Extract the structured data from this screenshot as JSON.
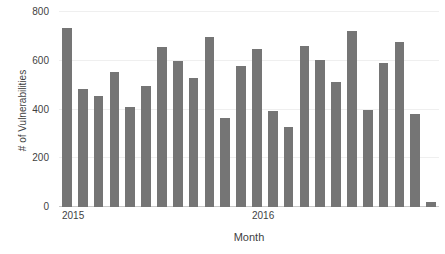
{
  "chart_data": {
    "type": "bar",
    "title": "",
    "xlabel": "Month",
    "ylabel": "# of Vulnerabilities",
    "ylim": [
      0,
      800
    ],
    "ytick_values": [
      0,
      200,
      400,
      600,
      800
    ],
    "ytick_labels": [
      "0",
      "200",
      "400",
      "600",
      "800"
    ],
    "grid": true,
    "legend": null,
    "bar_color": "#757575",
    "gridline_color": "#efefef",
    "axis_color": "#c9c9c9",
    "categories": [
      "2015-01",
      "2015-02",
      "2015-03",
      "2015-04",
      "2015-05",
      "2015-06",
      "2015-07",
      "2015-08",
      "2015-09",
      "2015-10",
      "2015-11",
      "2015-12",
      "2016-01",
      "2016-02",
      "2016-03",
      "2016-04",
      "2016-05",
      "2016-06",
      "2016-07",
      "2016-08",
      "2016-09",
      "2016-10",
      "2016-11",
      "2016-12"
    ],
    "values": [
      735,
      483,
      455,
      552,
      412,
      495,
      655,
      598,
      530,
      698,
      365,
      578,
      650,
      392,
      328,
      660,
      604,
      512,
      722,
      397,
      590,
      676,
      382,
      22
    ],
    "xtick_labels": [
      "2015",
      "2016"
    ],
    "xtick_positions": [
      0,
      12
    ]
  }
}
